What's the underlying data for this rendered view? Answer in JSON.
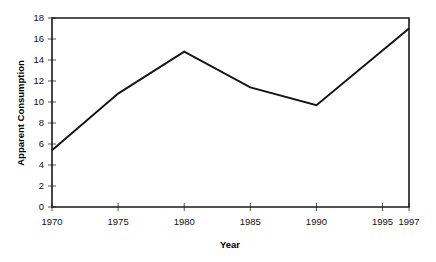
{
  "chart_data": {
    "type": "line",
    "title": "",
    "xlabel": "Year",
    "ylabel": "Apparent Consumption",
    "x": [
      1970,
      1975,
      1980,
      1985,
      1990,
      1997
    ],
    "values": [
      5.4,
      10.8,
      14.8,
      11.4,
      9.7,
      17.0
    ],
    "series": [
      {
        "name": "Apparent Consumption",
        "values": [
          5.4,
          10.8,
          14.8,
          11.4,
          9.7,
          17.0
        ],
        "color": "#141414"
      }
    ],
    "xlim": [
      1970,
      1997
    ],
    "ylim": [
      0,
      18
    ],
    "x_ticks": [
      1970,
      1975,
      1980,
      1985,
      1990,
      1995,
      1997
    ],
    "x_tick_labels": [
      "1970",
      "1975",
      "1980",
      "1985",
      "1990",
      "1995",
      "1997"
    ],
    "y_ticks": [
      0,
      2,
      4,
      6,
      8,
      10,
      12,
      14,
      16,
      18
    ],
    "y_tick_labels": [
      "0",
      "2",
      "4",
      "6",
      "8",
      "10",
      "12",
      "14",
      "16",
      "18"
    ],
    "grid": false,
    "legend": false,
    "legend_position": "none",
    "axis_color": "#1a1a1a",
    "background_color": "#ffffff"
  },
  "axes": {
    "x_title": "Year",
    "y_title": "Apparent Consumption"
  }
}
